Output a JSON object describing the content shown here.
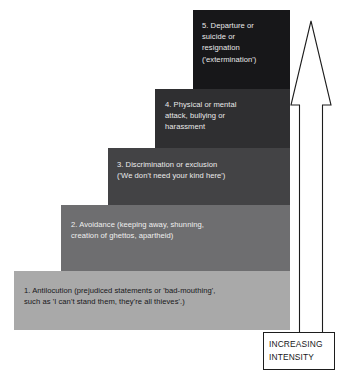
{
  "diagram": {
    "type": "staircase",
    "steps": [
      {
        "level": 1,
        "name": "antilocution",
        "text": "1. Antilocution (prejudiced statements or 'bad-mouthing',\nsuch as 'I can't stand them, they're all thieves'.)",
        "fill": "#a9a9a9",
        "text_color": "#17171a"
      },
      {
        "level": 2,
        "name": "avoidance",
        "text": "2. Avoidance (keeping away, shunning,\ncreation of ghettos, apartheid)",
        "fill": "#6e6e70",
        "text_color": "#efefef"
      },
      {
        "level": 3,
        "name": "discrimination",
        "text": "3. Discrimination or exclusion\n('We don't need your kind here')",
        "fill": "#434345",
        "text_color": "#ececec"
      },
      {
        "level": 4,
        "name": "physical-attack",
        "text": "4. Physical  or mental\nattack, bullying or\nharassment",
        "fill": "#2f2f31",
        "text_color": "#e9e9e9"
      },
      {
        "level": 5,
        "name": "extermination",
        "text": "5. Departure or\nsuicide or\nresignation\n('extermination')",
        "fill": "#171719",
        "text_color": "#e9e9e9"
      }
    ],
    "arrow": {
      "name": "increasing-intensity-arrow",
      "direction": "up",
      "outline_color": "#1d1d1d",
      "fill": "#ffffff"
    },
    "label": {
      "line1": "INCREASING",
      "line2": "INTENSITY",
      "border_color": "#1d1d1d",
      "text_color": "#17171a"
    }
  }
}
